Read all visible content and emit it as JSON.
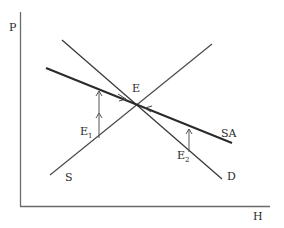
{
  "diagram": {
    "type": "supply-demand",
    "axes": {
      "y_label": "P",
      "x_label": "H"
    },
    "curves": {
      "supply": {
        "label": "S",
        "from": [
          50,
          175
        ],
        "to": [
          212,
          44
        ]
      },
      "demand": {
        "label": "D",
        "from": [
          62,
          40
        ],
        "to": [
          222,
          179
        ]
      },
      "supply_adjusted": {
        "label": "SA",
        "from": [
          46,
          68
        ],
        "to": [
          232,
          143
        ]
      }
    },
    "points": {
      "equilibrium": {
        "label": "E",
        "at": [
          135,
          105
        ]
      },
      "e1": {
        "label": "E",
        "subscript": "1"
      },
      "e2": {
        "label": "E",
        "subscript": "2"
      }
    },
    "colors": {
      "line": "#2e2e2e",
      "axis": "#6a6a6a",
      "arrow": "#555555"
    }
  }
}
